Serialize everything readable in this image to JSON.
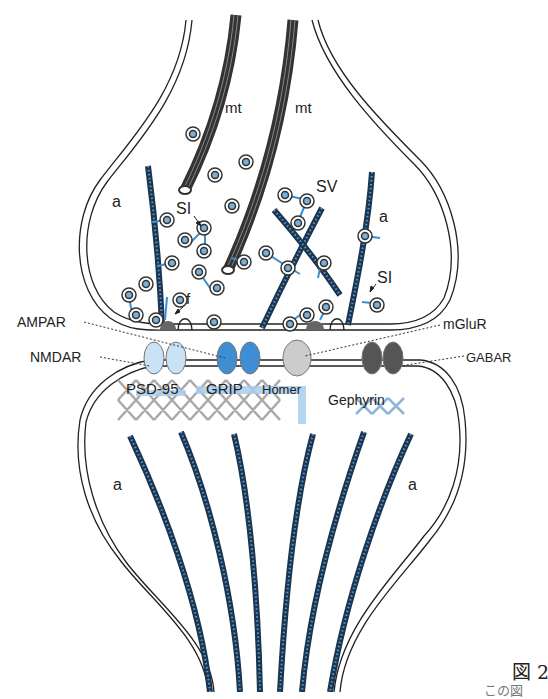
{
  "diagram": {
    "type": "synapse-schematic",
    "labels": {
      "mt_left": "mt",
      "mt_right": "mt",
      "a_pre_left": "a",
      "a_pre_right": "a",
      "a_post_left": "a",
      "a_post_right": "a",
      "sv": "SV",
      "si_left": "SI",
      "si_right": "SI",
      "f": "f",
      "ampar": "AMPAR",
      "nmdar": "NMDAR",
      "mglur": "mGluR",
      "gabar": "GABAR",
      "psd95": "PSD-95",
      "grip": "GRIP",
      "homer": "Homer",
      "gephyrin": "Gephyrin"
    },
    "caption": {
      "fig_label": "図 2",
      "line2": "この図"
    },
    "colors": {
      "membrane": "#222222",
      "actin": "#1c3550",
      "actin_dots": "#5a9ccc",
      "microtubule": "#555555",
      "vesicle_fill": "#7ab0d8",
      "linker": "#3a8fd0",
      "nmdar": "#c9e2f5",
      "ampar": "#3d8ed2",
      "homer": "#cccccc",
      "gabar": "#555555",
      "psd_scaffold": "#a9a9a9",
      "grip_scaffold": "#a9cdec",
      "gephyrin_scaffold": "#8fb6d8"
    }
  }
}
